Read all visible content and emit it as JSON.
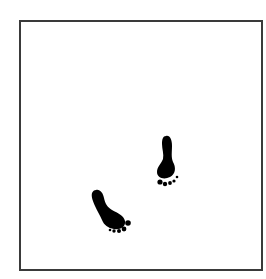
{
  "illustration": {
    "frame": {
      "border_color": "#3a3a3a",
      "background": "#ffffff"
    },
    "footprints": [
      {
        "name": "right-footprint",
        "color": "#000000"
      },
      {
        "name": "left-footprint",
        "color": "#000000"
      }
    ]
  }
}
